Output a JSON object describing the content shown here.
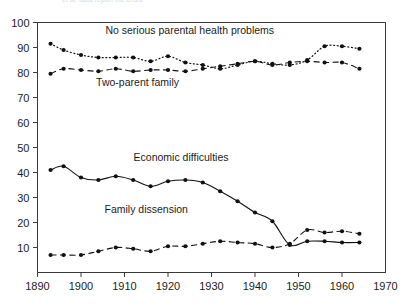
{
  "figure": {
    "caption_fragment": "et al. data report the crisis"
  },
  "chart_data": {
    "type": "line",
    "title": "",
    "subtitle": "",
    "xlabel": "",
    "ylabel": "",
    "xlim": [
      1890,
      1970
    ],
    "ylim": [
      0,
      100
    ],
    "xticks": [
      1890,
      1900,
      1910,
      1920,
      1930,
      1940,
      1950,
      1960,
      1970
    ],
    "xticklabels": [
      "1890",
      "1900",
      "1910",
      "1920",
      "1930",
      "1940",
      "1950",
      "1960",
      "1970"
    ],
    "yticks": [
      10,
      20,
      30,
      40,
      50,
      60,
      70,
      80,
      90,
      100
    ],
    "yticklabels": [
      "10",
      "20",
      "30",
      "40",
      "50",
      "60",
      "70",
      "80",
      "90",
      "100"
    ],
    "grid": false,
    "legend": "inline-annotations",
    "frame": true,
    "series": [
      {
        "name": "No serious parental health problems",
        "linestyle": "dotted",
        "marker": "filled-circle",
        "color": "#111111",
        "label_x": 1925,
        "label_y": 95.5,
        "x": [
          1893,
          1896,
          1900,
          1904,
          1908,
          1912,
          1916,
          1920,
          1924,
          1928,
          1932,
          1936,
          1940,
          1944,
          1948,
          1952,
          1956,
          1960,
          1964
        ],
        "y": [
          91.5,
          89.0,
          87.0,
          86.0,
          86.0,
          86.0,
          84.5,
          86.5,
          84.0,
          83.0,
          81.5,
          83.0,
          84.5,
          83.5,
          83.0,
          85.0,
          90.5,
          90.5,
          89.5
        ]
      },
      {
        "name": "Two-parent family",
        "linestyle": "dashed",
        "marker": "filled-circle",
        "color": "#111111",
        "label_x": 1913,
        "label_y": 74.5,
        "x": [
          1893,
          1896,
          1900,
          1904,
          1908,
          1912,
          1916,
          1920,
          1924,
          1928,
          1932,
          1936,
          1940,
          1944,
          1948,
          1952,
          1956,
          1960,
          1964
        ],
        "y": [
          79.5,
          81.5,
          81.0,
          80.5,
          81.5,
          80.5,
          81.0,
          81.0,
          80.5,
          81.5,
          82.5,
          83.5,
          84.5,
          83.0,
          84.0,
          84.5,
          84.0,
          84.0,
          81.5
        ]
      },
      {
        "name": "Economic difficulties",
        "linestyle": "solid",
        "marker": "filled-circle",
        "color": "#111111",
        "label_x": 1923,
        "label_y": 44.5,
        "x": [
          1893,
          1896,
          1900,
          1904,
          1908,
          1912,
          1916,
          1920,
          1924,
          1928,
          1932,
          1936,
          1940,
          1944,
          1948,
          1952,
          1956,
          1960,
          1964
        ],
        "y": [
          41.0,
          42.5,
          38.0,
          37.0,
          38.5,
          37.0,
          34.5,
          36.5,
          37.0,
          36.0,
          32.5,
          28.5,
          24.0,
          20.5,
          11.0,
          12.5,
          12.5,
          12.0,
          12.0
        ]
      },
      {
        "name": "Family dissension",
        "linestyle": "dashed",
        "marker": "filled-circle",
        "color": "#111111",
        "label_x": 1915,
        "label_y": 24.0,
        "x": [
          1893,
          1896,
          1900,
          1904,
          1908,
          1912,
          1916,
          1920,
          1924,
          1928,
          1932,
          1936,
          1940,
          1944,
          1948,
          1952,
          1956,
          1960,
          1964
        ],
        "y": [
          7.0,
          7.0,
          7.0,
          8.5,
          10.0,
          9.5,
          8.5,
          10.5,
          10.5,
          11.5,
          12.5,
          12.0,
          11.5,
          10.0,
          11.5,
          17.0,
          16.0,
          16.5,
          15.5
        ]
      }
    ]
  }
}
